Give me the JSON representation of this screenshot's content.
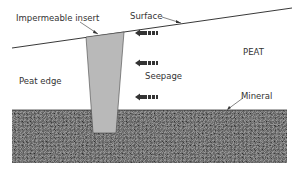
{
  "labels": {
    "insert": "Impermeable insert",
    "surface": "Surface",
    "peat": "PEAT",
    "peat_edge": "Peat edge",
    "seepage": "Seepage",
    "mineral": "Mineral"
  },
  "colors": {
    "insert_fill": "#b8b8b8",
    "mineral_base": "#5a5a5a",
    "line": "#222222"
  }
}
